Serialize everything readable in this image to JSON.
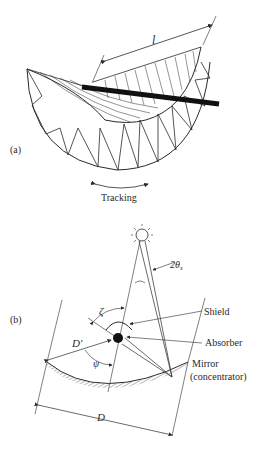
{
  "figure": {
    "panel_a": {
      "label": "(a)",
      "length_label": "l",
      "tracking_label": "Tracking"
    },
    "panel_b": {
      "label": "(b)",
      "sun_angle_label": "2θ",
      "sun_angle_subscript": "s",
      "zeta_label": "ζ",
      "psi_label": "ψ",
      "d_prime_label": "D′",
      "d_label": "D",
      "shield_label": "Shield",
      "absorber_label": "Absorber",
      "mirror_label_line1": "Mirror",
      "mirror_label_line2": "(concentrator)"
    },
    "colors": {
      "ink": "#2a2a2a",
      "absorber_tube": "#111111",
      "background": "#ffffff"
    }
  }
}
